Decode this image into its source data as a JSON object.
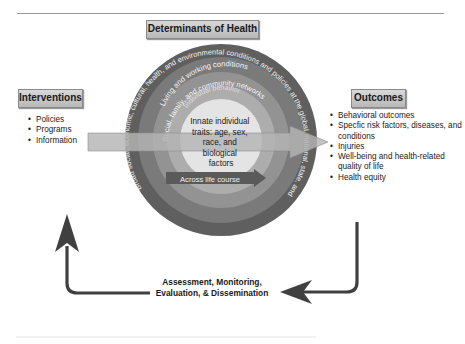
{
  "header": {
    "title": "Determinants of Health"
  },
  "interventions": {
    "title": "Interventions",
    "items": [
      "Policies",
      "Programs",
      "Information"
    ]
  },
  "outcomes": {
    "title": "Outcomes",
    "items": [
      "Behavioral outcomes",
      "Specfic risk factors, diseases, and conditions",
      "Injuries",
      "Well-being and health-related quality of life",
      "Health equity"
    ]
  },
  "rings": {
    "outer": "Broad social, economic, cultural, health, and environmental conditions and policies at the global, national, state, and local levels",
    "living": "Living and working conditions",
    "social": "Social, family, and community networks",
    "individual": "Individual behavior",
    "core": "Innate individual traits: age, sex, race, and biological factors",
    "core_lines": [
      "Innate individual",
      "traits: age, sex,",
      "race, and",
      "biological",
      "factors"
    ],
    "life_course": "Across life course"
  },
  "feedback": {
    "line1": "Assessment, Monitoring,",
    "line2": "Evaluation, & Dissemination"
  },
  "colors": {
    "outer_ring": "#5f5f5f",
    "ring2": "#7a7a7a",
    "ring3": "#939393",
    "ring4": "#adadad",
    "core": "#e4e4e4",
    "arrow": "#404040",
    "band": "#b5b5b5"
  }
}
